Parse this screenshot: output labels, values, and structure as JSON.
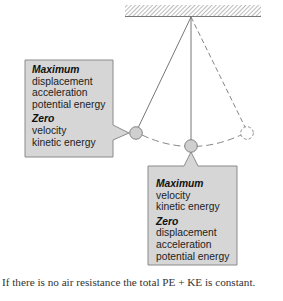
{
  "diagram": {
    "colors": {
      "box_fill": "#d6d6d6",
      "box_stroke": "#8a8a8a",
      "bob_fill": "#cfcfcf",
      "line": "#666666",
      "ceiling": "#777777"
    },
    "left_box": {
      "max_heading": "Maximum",
      "max_items": [
        "displacement",
        "acceleration",
        "potential energy"
      ],
      "zero_heading": "Zero",
      "zero_items": [
        "velocity",
        "kinetic energy"
      ]
    },
    "bottom_box": {
      "max_heading": "Maximum",
      "max_items": [
        "velocity",
        "kinetic energy"
      ],
      "zero_heading": "Zero",
      "zero_items": [
        "displacement",
        "acceleration",
        "potential energy"
      ]
    },
    "caption": "If there is no air resistance the total PE + KE is constant."
  }
}
